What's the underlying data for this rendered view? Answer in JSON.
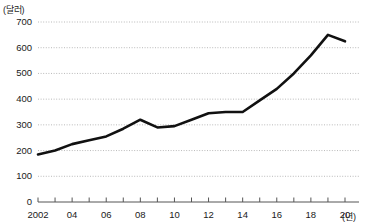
{
  "chart_data": {
    "type": "line",
    "title": "",
    "xlabel": "(년)",
    "ylabel": "(달러)",
    "unit_y_label": "(달러)",
    "unit_x_label": "(년)",
    "grid": true,
    "legend": "none",
    "ylim": [
      0,
      700
    ],
    "ytick_labels": [
      "0",
      "100",
      "200",
      "300",
      "400",
      "500",
      "600",
      "700"
    ],
    "ytick_values": [
      0,
      100,
      200,
      300,
      400,
      500,
      600,
      700
    ],
    "xlim": [
      2002,
      2020
    ],
    "xtick_labels": [
      "2002",
      "04",
      "06",
      "08",
      "10",
      "12",
      "14",
      "16",
      "18",
      "20"
    ],
    "xtick_values": [
      2002,
      2004,
      2006,
      2008,
      2010,
      2012,
      2014,
      2016,
      2018,
      2020
    ],
    "minor_xticks": [
      2002,
      2003,
      2004,
      2005,
      2006,
      2007,
      2008,
      2009,
      2010,
      2011,
      2012,
      2013,
      2014,
      2015,
      2016,
      2017,
      2018,
      2019,
      2020
    ],
    "x": [
      2002,
      2003,
      2004,
      2005,
      2006,
      2007,
      2008,
      2009,
      2010,
      2011,
      2012,
      2013,
      2014,
      2015,
      2016,
      2017,
      2018,
      2019,
      2020
    ],
    "values": [
      185,
      200,
      225,
      240,
      255,
      285,
      320,
      290,
      295,
      320,
      345,
      350,
      350,
      395,
      440,
      500,
      570,
      650,
      625
    ],
    "line_color": "#111111",
    "line_width": 2.6,
    "grid_color": "#b9b9b9",
    "axis_color": "#555555"
  }
}
